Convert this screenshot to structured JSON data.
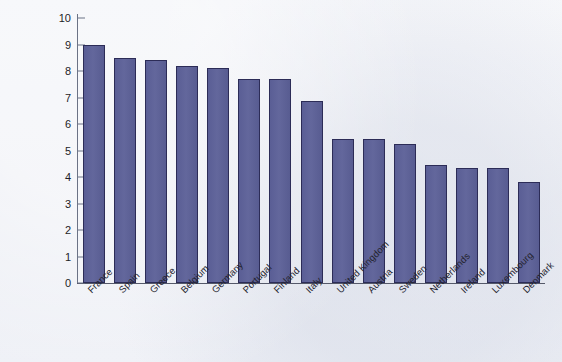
{
  "chart_data": {
    "type": "bar",
    "title": "",
    "subtitle": "",
    "xlabel": "",
    "ylabel": "",
    "ylim": [
      0,
      10
    ],
    "yticks": [
      0,
      1,
      2,
      3,
      4,
      5,
      6,
      7,
      8,
      9,
      10
    ],
    "ytick_labels": [
      "0",
      "1",
      "2",
      "3",
      "4",
      "5",
      "6",
      "7",
      "8",
      "9",
      "10"
    ],
    "grid": false,
    "legend": null,
    "categories": [
      "France",
      "Spain",
      "Greece",
      "Belgium",
      "Germany",
      "Portugal",
      "Finland",
      "Italy",
      "United Kingdom",
      "Austria",
      "Sweden",
      "Netherlands",
      "Ireland",
      "Luxembourg",
      "Denmark"
    ],
    "values": [
      9.0,
      8.5,
      8.4,
      8.2,
      8.1,
      7.7,
      7.7,
      6.85,
      5.45,
      5.45,
      5.25,
      4.45,
      4.35,
      4.35,
      3.8
    ],
    "bar_color": "#5b5f96",
    "bar_edge_color": "#2c2c57",
    "background_color": "#edeff5",
    "axis_color": "#55596a"
  }
}
